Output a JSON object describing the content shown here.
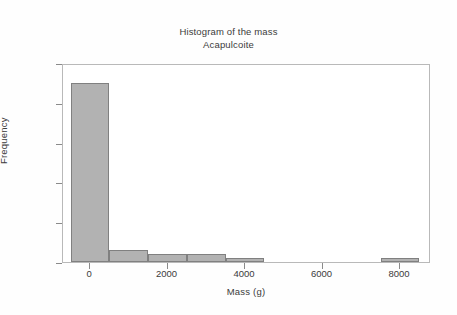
{
  "chart_data": {
    "type": "bar",
    "title": "Histogram of the mass",
    "subtitle": "Acapulcoite",
    "title_lines": [
      "Histogram of the mass",
      "Acapulcoite"
    ],
    "xlabel": "Mass (g)",
    "ylabel": "Frequency",
    "xlim": [
      -700,
      8800
    ],
    "ylim": [
      0,
      50
    ],
    "grid": false,
    "legend": null,
    "bin_width": 1000,
    "bar_color": "#b2b2b2",
    "bar_edge_color": "#808080",
    "plot_background": "#ffffff",
    "figure_background": "#fefefe",
    "axis_color": "#8a8a8a",
    "text_color": "#3b3b3b",
    "xticks": [
      {
        "value": 0,
        "label": "0"
      },
      {
        "value": 2000,
        "label": "2000"
      },
      {
        "value": 4000,
        "label": "4000"
      },
      {
        "value": 6000,
        "label": "6000"
      },
      {
        "value": 8000,
        "label": "8000"
      }
    ],
    "yticks": [
      {
        "value": 0,
        "label": "0"
      },
      {
        "value": 10,
        "label": "10"
      },
      {
        "value": 20,
        "label": "20"
      },
      {
        "value": 30,
        "label": "30"
      },
      {
        "value": 40,
        "label": "40"
      },
      {
        "value": 50,
        "label": "50"
      }
    ],
    "bins": [
      {
        "start": -500,
        "end": 500,
        "center": 0,
        "frequency": 45
      },
      {
        "start": 500,
        "end": 1500,
        "center": 1000,
        "frequency": 3
      },
      {
        "start": 1500,
        "end": 2500,
        "center": 2000,
        "frequency": 2
      },
      {
        "start": 2500,
        "end": 3500,
        "center": 3000,
        "frequency": 2
      },
      {
        "start": 3500,
        "end": 4500,
        "center": 4000,
        "frequency": 1
      },
      {
        "start": 4500,
        "end": 5500,
        "center": 5000,
        "frequency": 0
      },
      {
        "start": 5500,
        "end": 6500,
        "center": 6000,
        "frequency": 0
      },
      {
        "start": 6500,
        "end": 7500,
        "center": 7000,
        "frequency": 0
      },
      {
        "start": 7500,
        "end": 8500,
        "center": 8000,
        "frequency": 1
      }
    ],
    "categories": [
      "-500–500",
      "500–1500",
      "1500–2500",
      "2500–3500",
      "3500–4500",
      "4500–5500",
      "5500–6500",
      "6500–7500",
      "7500–8500"
    ],
    "values": [
      45,
      3,
      2,
      2,
      1,
      0,
      0,
      0,
      1
    ]
  }
}
